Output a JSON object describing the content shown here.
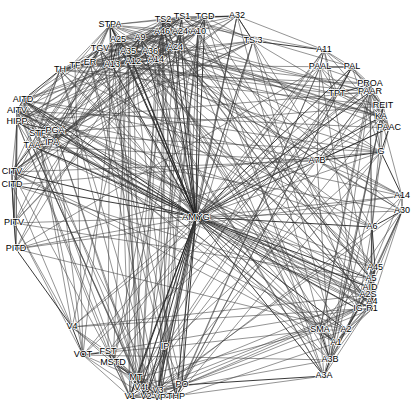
{
  "figure": {
    "type": "node-link-graph",
    "title": "",
    "width": 415,
    "height": 412,
    "background_color": "#ffffff",
    "edge_color": "#3a3a3a",
    "node_color": "#111111",
    "label_color": "#000000",
    "layout": "circular force-directed",
    "hub_node": "AMYG"
  },
  "chart_data": {
    "type": "scatter",
    "title": "",
    "xlabel": "",
    "ylabel": "",
    "grid": false,
    "legend": "none",
    "nodes": [
      {
        "id": "STPA",
        "label": "STPA",
        "x": 110,
        "y": 25,
        "anchor": "middle"
      },
      {
        "id": "A25",
        "label": "A25",
        "x": 118,
        "y": 40,
        "anchor": "middle"
      },
      {
        "id": "A9",
        "label": "A9",
        "x": 140,
        "y": 38,
        "anchor": "middle"
      },
      {
        "id": "TS2",
        "label": "TS2",
        "x": 163,
        "y": 20,
        "anchor": "middle"
      },
      {
        "id": "TS1",
        "label": "TS1",
        "x": 182,
        "y": 17,
        "anchor": "middle"
      },
      {
        "id": "TGD",
        "label": "TGD",
        "x": 205,
        "y": 17,
        "anchor": "middle"
      },
      {
        "id": "A32",
        "label": "A32",
        "x": 237,
        "y": 16,
        "anchor": "middle"
      },
      {
        "id": "TS3",
        "label": "TS 3",
        "x": 253,
        "y": 41,
        "anchor": "middle"
      },
      {
        "id": "A46",
        "label": "A46",
        "x": 162,
        "y": 32,
        "anchor": "middle"
      },
      {
        "id": "A24",
        "label": "A24",
        "x": 180,
        "y": 32,
        "anchor": "middle"
      },
      {
        "id": "A10",
        "label": "A10",
        "x": 198,
        "y": 32,
        "anchor": "middle"
      },
      {
        "id": "TGV",
        "label": "TGV",
        "x": 100,
        "y": 49,
        "anchor": "middle"
      },
      {
        "id": "A35",
        "label": "A35",
        "x": 128,
        "y": 52,
        "anchor": "middle"
      },
      {
        "id": "A36",
        "label": "A36",
        "x": 150,
        "y": 52,
        "anchor": "middle"
      },
      {
        "id": "A24b",
        "label": "A24",
        "x": 175,
        "y": 48,
        "anchor": "middle"
      },
      {
        "id": "ER",
        "label": "ER",
        "x": 90,
        "y": 63,
        "anchor": "middle"
      },
      {
        "id": "A13",
        "label": "A13",
        "x": 112,
        "y": 65,
        "anchor": "middle"
      },
      {
        "id": "A12",
        "label": "A12",
        "x": 133,
        "y": 62,
        "anchor": "middle"
      },
      {
        "id": "A14",
        "label": "A14",
        "x": 156,
        "y": 60,
        "anchor": "middle"
      },
      {
        "id": "TH",
        "label": "TH",
        "x": 60,
        "y": 70,
        "anchor": "middle"
      },
      {
        "id": "TF",
        "label": "TF",
        "x": 75,
        "y": 66,
        "anchor": "middle"
      },
      {
        "id": "AITD",
        "label": "AITD",
        "x": 23,
        "y": 100,
        "anchor": "middle"
      },
      {
        "id": "AITV",
        "label": "AITV",
        "x": 17,
        "y": 111,
        "anchor": "middle"
      },
      {
        "id": "HIPP",
        "label": "HIPP",
        "x": 17,
        "y": 122,
        "anchor": "middle"
      },
      {
        "id": "STP",
        "label": "STP",
        "x": 38,
        "y": 134,
        "anchor": "middle"
      },
      {
        "id": "PGA",
        "label": "PGA",
        "x": 55,
        "y": 131,
        "anchor": "middle"
      },
      {
        "id": "IPA",
        "label": "IPA",
        "x": 52,
        "y": 143,
        "anchor": "middle"
      },
      {
        "id": "TAA",
        "label": "TAA",
        "x": 32,
        "y": 146,
        "anchor": "middle"
      },
      {
        "id": "CITV",
        "label": "CITV",
        "x": 12,
        "y": 172,
        "anchor": "middle"
      },
      {
        "id": "CITD",
        "label": "CITD",
        "x": 12,
        "y": 185,
        "anchor": "middle"
      },
      {
        "id": "PITV",
        "label": "PITV",
        "x": 14,
        "y": 223,
        "anchor": "middle"
      },
      {
        "id": "PITD",
        "label": "PITD",
        "x": 16,
        "y": 249,
        "anchor": "middle"
      },
      {
        "id": "V4",
        "label": "V4",
        "x": 72,
        "y": 327,
        "anchor": "middle"
      },
      {
        "id": "VOT",
        "label": "VOT",
        "x": 83,
        "y": 355,
        "anchor": "middle"
      },
      {
        "id": "FST",
        "label": "FST",
        "x": 108,
        "y": 352,
        "anchor": "middle"
      },
      {
        "id": "MSTD",
        "label": "MSTD",
        "x": 113,
        "y": 363,
        "anchor": "middle"
      },
      {
        "id": "MT",
        "label": "MT",
        "x": 136,
        "y": 378,
        "anchor": "middle"
      },
      {
        "id": "V4t",
        "label": "V4t",
        "x": 141,
        "y": 388,
        "anchor": "middle"
      },
      {
        "id": "V1",
        "label": "V1",
        "x": 130,
        "y": 397,
        "anchor": "middle"
      },
      {
        "id": "V2",
        "label": "V2",
        "x": 146,
        "y": 397,
        "anchor": "middle"
      },
      {
        "id": "V3",
        "label": "V3",
        "x": 158,
        "y": 391,
        "anchor": "middle"
      },
      {
        "id": "VP",
        "label": "VP",
        "x": 160,
        "y": 398,
        "anchor": "middle"
      },
      {
        "id": "THP",
        "label": "THP",
        "x": 176,
        "y": 397,
        "anchor": "middle"
      },
      {
        "id": "PO",
        "label": "PO",
        "x": 182,
        "y": 385,
        "anchor": "middle"
      },
      {
        "id": "IP",
        "label": "IP",
        "x": 165,
        "y": 347,
        "anchor": "middle"
      },
      {
        "id": "AMYG",
        "label": "AMYG",
        "x": 196,
        "y": 217,
        "anchor": "middle"
      },
      {
        "id": "A11",
        "label": "A11",
        "x": 324,
        "y": 50,
        "anchor": "middle"
      },
      {
        "id": "PAAL",
        "label": "PAAL",
        "x": 320,
        "y": 67,
        "anchor": "middle"
      },
      {
        "id": "PAL",
        "label": "PAL",
        "x": 352,
        "y": 67,
        "anchor": "middle"
      },
      {
        "id": "PROA",
        "label": "PROA",
        "x": 370,
        "y": 84,
        "anchor": "middle"
      },
      {
        "id": "PAAR",
        "label": "PAAR",
        "x": 370,
        "y": 92,
        "anchor": "middle"
      },
      {
        "id": "TPT",
        "label": "TPT",
        "x": 337,
        "y": 94,
        "anchor": "middle"
      },
      {
        "id": "REIT",
        "label": "REIT",
        "x": 383,
        "y": 106,
        "anchor": "middle"
      },
      {
        "id": "KA",
        "label": "KA",
        "x": 381,
        "y": 117,
        "anchor": "middle"
      },
      {
        "id": "PAAC",
        "label": "PAAC",
        "x": 389,
        "y": 128,
        "anchor": "middle"
      },
      {
        "id": "A7B",
        "label": "A7B",
        "x": 317,
        "y": 161,
        "anchor": "middle"
      },
      {
        "id": "G",
        "label": "G",
        "x": 381,
        "y": 152,
        "anchor": "middle"
      },
      {
        "id": "A14R",
        "label": "A14",
        "x": 402,
        "y": 196,
        "anchor": "middle"
      },
      {
        "id": "A30",
        "label": "A30",
        "x": 402,
        "y": 211,
        "anchor": "middle"
      },
      {
        "id": "A6",
        "label": "A6",
        "x": 372,
        "y": 227,
        "anchor": "middle"
      },
      {
        "id": "A45",
        "label": "A45",
        "x": 375,
        "y": 268,
        "anchor": "middle"
      },
      {
        "id": "A5",
        "label": "A5",
        "x": 371,
        "y": 279,
        "anchor": "middle"
      },
      {
        "id": "AID",
        "label": "AID",
        "x": 370,
        "y": 288,
        "anchor": "middle"
      },
      {
        "id": "A2S",
        "label": "A2S",
        "x": 368,
        "y": 295,
        "anchor": "middle"
      },
      {
        "id": "A4",
        "label": "A4",
        "x": 372,
        "y": 302,
        "anchor": "middle"
      },
      {
        "id": "IG",
        "label": "IG",
        "x": 358,
        "y": 309,
        "anchor": "middle"
      },
      {
        "id": "R1",
        "label": "R1",
        "x": 372,
        "y": 309,
        "anchor": "middle"
      },
      {
        "id": "SMA",
        "label": "SMA",
        "x": 320,
        "y": 330,
        "anchor": "middle"
      },
      {
        "id": "A2",
        "label": "A2",
        "x": 346,
        "y": 330,
        "anchor": "middle"
      },
      {
        "id": "A1",
        "label": "A1",
        "x": 336,
        "y": 343,
        "anchor": "middle"
      },
      {
        "id": "A3B",
        "label": "A3B",
        "x": 330,
        "y": 360,
        "anchor": "middle"
      },
      {
        "id": "A3A",
        "label": "A3A",
        "x": 324,
        "y": 376,
        "anchor": "middle"
      }
    ],
    "edge_count_approx": 520,
    "hub_edges_from": "AMYG"
  }
}
